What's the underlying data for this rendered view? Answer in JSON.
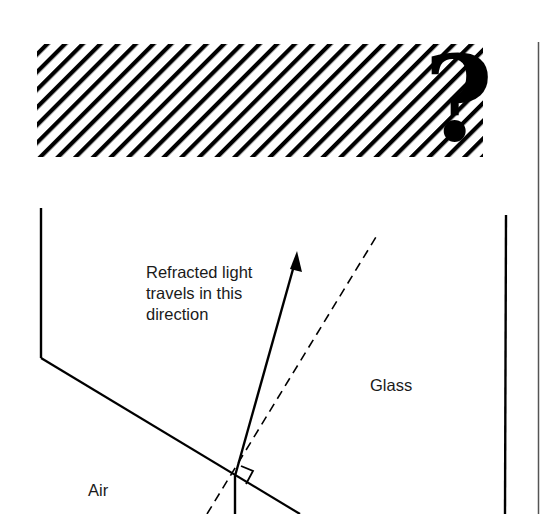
{
  "header_banner": {
    "pattern": "diagonal-hatch",
    "icon": "question-mark-icon",
    "icon_glyph": "?"
  },
  "diagram": {
    "labels": {
      "refracted_line1": "Refracted light",
      "refracted_line2": "travels in this",
      "refracted_line3": "direction",
      "glass": "Glass",
      "air": "Air"
    },
    "elements": [
      "glass-boundary-surface",
      "incident-ray",
      "refracted-ray-arrow",
      "normal-dashed-line",
      "right-angle-marker"
    ]
  },
  "colors": {
    "ink": "#000000",
    "background": "#ffffff"
  }
}
